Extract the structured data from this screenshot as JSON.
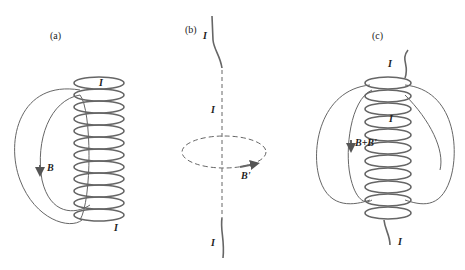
{
  "panels": [
    {
      "id": "a",
      "label": "(a)",
      "current_label": "I",
      "field_label": "B"
    },
    {
      "id": "b",
      "label": "(b)",
      "current_label": "I",
      "field_label": "B'"
    },
    {
      "id": "c",
      "label": "(c)",
      "current_label": "I",
      "field_label": "B+B'"
    }
  ],
  "colors": {
    "line": "#666666",
    "text": "#222222",
    "background": "#ffffff"
  }
}
